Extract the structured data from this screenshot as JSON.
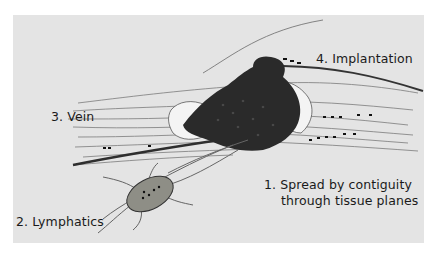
{
  "diagram": {
    "colors": {
      "page": "#ffffff",
      "panel": "#e4e4e4",
      "tumor": "#2a2a2a",
      "tissue_lines": "#555555",
      "node": "#8a8a82",
      "text": "#1a1a1a"
    },
    "labels": {
      "implantation": "4. Implantation",
      "vein": "3. Vein",
      "contiguity_line1": "1. Spread by contiguity",
      "contiguity_line2": "through tissue planes",
      "lymphatics": "2. Lymphatics"
    }
  }
}
